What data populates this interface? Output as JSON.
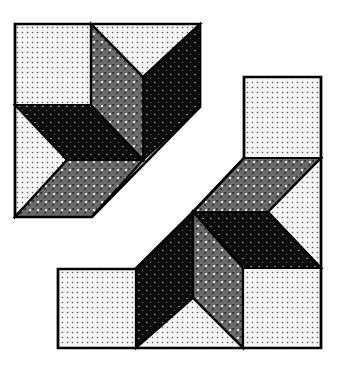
{
  "figure": {
    "title": "",
    "colors": {
      "background": "#ffffff",
      "light": "#f2f2f2",
      "light_dot": "#555555",
      "gray": "#6e6e6e",
      "gray_dot": "#ffffff",
      "black": "#0d0d0d",
      "black_dot": "#9a9a9a",
      "outline": "#000000"
    },
    "pieces": {
      "upper_left": [
        {
          "name": "square",
          "fill": "light",
          "points": "15,24 91,24 91,105 15,105"
        },
        {
          "name": "top-triangle",
          "fill": "light",
          "points": "91,24 200,24 143,77"
        },
        {
          "name": "vertical-diamond",
          "fill": "gray",
          "points": "91,24 143,77 143,160 91,105"
        },
        {
          "name": "right-diamond",
          "fill": "black",
          "points": "143,77 200,24 200,107 143,160"
        },
        {
          "name": "horizontal-diamond",
          "fill": "black",
          "points": "15,105 91,105 143,160 67,160"
        },
        {
          "name": "left-triangle",
          "fill": "light",
          "points": "15,105 67,160 15,217"
        },
        {
          "name": "bottom-diamond",
          "fill": "gray",
          "points": "67,160 143,160 92,217 15,217"
        }
      ],
      "lower_right": [
        {
          "name": "top-square",
          "fill": "light",
          "points": "244,77 321,77 321,158 244,158"
        },
        {
          "name": "top-diamond",
          "fill": "gray",
          "points": "244,158 321,158 268,212 193,212"
        },
        {
          "name": "right-triangle",
          "fill": "light",
          "points": "321,158 321,268 268,212"
        },
        {
          "name": "right-diamond",
          "fill": "black",
          "points": "193,212 268,212 321,268 243,268"
        },
        {
          "name": "vertical-diamond",
          "fill": "gray",
          "points": "193,212 243,268 243,348 193,298"
        },
        {
          "name": "left-diamond",
          "fill": "black",
          "points": "136,268 193,212 193,298 136,348"
        },
        {
          "name": "bottom-triangle",
          "fill": "light",
          "points": "136,348 193,298 243,348"
        },
        {
          "name": "left-square",
          "fill": "light",
          "points": "58,269 136,269 136,348 58,348"
        },
        {
          "name": "right-square",
          "fill": "light",
          "points": "243,268 321,268 321,348 243,348"
        }
      ]
    },
    "outlines": {
      "upper_left": "15,24 200,24 200,107 92,217 15,217",
      "lower_right": "244,77 321,77 321,348 58,348 58,269 136,269 193,212 244,158"
    }
  }
}
